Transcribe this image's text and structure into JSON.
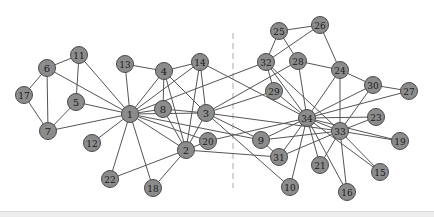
{
  "diagram": {
    "type": "network-graph",
    "node_fill": "#8c8c8c",
    "node_stroke": "#4a4a4a",
    "edge_color": "#555555",
    "divider_color": "#aaaaaa",
    "divider_x": 233,
    "nodes": [
      {
        "id": "1",
        "x": 130,
        "y": 114
      },
      {
        "id": "2",
        "x": 186,
        "y": 150
      },
      {
        "id": "3",
        "x": 206,
        "y": 113
      },
      {
        "id": "4",
        "x": 164,
        "y": 71
      },
      {
        "id": "5",
        "x": 76,
        "y": 102
      },
      {
        "id": "6",
        "x": 47,
        "y": 68
      },
      {
        "id": "7",
        "x": 48,
        "y": 131
      },
      {
        "id": "8",
        "x": 163,
        "y": 109
      },
      {
        "id": "9",
        "x": 261,
        "y": 140
      },
      {
        "id": "10",
        "x": 290,
        "y": 187
      },
      {
        "id": "11",
        "x": 79,
        "y": 55
      },
      {
        "id": "12",
        "x": 92,
        "y": 143
      },
      {
        "id": "13",
        "x": 125,
        "y": 64
      },
      {
        "id": "14",
        "x": 200,
        "y": 62
      },
      {
        "id": "15",
        "x": 380,
        "y": 172
      },
      {
        "id": "16",
        "x": 347,
        "y": 192
      },
      {
        "id": "17",
        "x": 24,
        "y": 95
      },
      {
        "id": "18",
        "x": 153,
        "y": 188
      },
      {
        "id": "19",
        "x": 400,
        "y": 141
      },
      {
        "id": "20",
        "x": 208,
        "y": 141
      },
      {
        "id": "21",
        "x": 320,
        "y": 165
      },
      {
        "id": "22",
        "x": 110,
        "y": 179
      },
      {
        "id": "23",
        "x": 376,
        "y": 117
      },
      {
        "id": "24",
        "x": 340,
        "y": 70
      },
      {
        "id": "25",
        "x": 279,
        "y": 31
      },
      {
        "id": "26",
        "x": 320,
        "y": 25
      },
      {
        "id": "27",
        "x": 409,
        "y": 91
      },
      {
        "id": "28",
        "x": 298,
        "y": 61
      },
      {
        "id": "29",
        "x": 274,
        "y": 91
      },
      {
        "id": "30",
        "x": 373,
        "y": 85
      },
      {
        "id": "31",
        "x": 279,
        "y": 157
      },
      {
        "id": "32",
        "x": 266,
        "y": 62
      },
      {
        "id": "33",
        "x": 340,
        "y": 131
      },
      {
        "id": "34",
        "x": 307,
        "y": 118
      }
    ],
    "edges": [
      [
        "1",
        "2"
      ],
      [
        "1",
        "3"
      ],
      [
        "1",
        "4"
      ],
      [
        "1",
        "5"
      ],
      [
        "1",
        "6"
      ],
      [
        "1",
        "7"
      ],
      [
        "1",
        "8"
      ],
      [
        "1",
        "9"
      ],
      [
        "1",
        "11"
      ],
      [
        "1",
        "12"
      ],
      [
        "1",
        "13"
      ],
      [
        "1",
        "14"
      ],
      [
        "1",
        "18"
      ],
      [
        "1",
        "20"
      ],
      [
        "1",
        "22"
      ],
      [
        "1",
        "32"
      ],
      [
        "2",
        "3"
      ],
      [
        "2",
        "4"
      ],
      [
        "2",
        "8"
      ],
      [
        "2",
        "14"
      ],
      [
        "2",
        "18"
      ],
      [
        "2",
        "20"
      ],
      [
        "2",
        "22"
      ],
      [
        "2",
        "31"
      ],
      [
        "3",
        "4"
      ],
      [
        "3",
        "8"
      ],
      [
        "3",
        "9"
      ],
      [
        "3",
        "10"
      ],
      [
        "3",
        "14"
      ],
      [
        "3",
        "28"
      ],
      [
        "3",
        "29"
      ],
      [
        "3",
        "33"
      ],
      [
        "4",
        "8"
      ],
      [
        "4",
        "13"
      ],
      [
        "4",
        "14"
      ],
      [
        "5",
        "7"
      ],
      [
        "5",
        "11"
      ],
      [
        "6",
        "7"
      ],
      [
        "6",
        "11"
      ],
      [
        "6",
        "17"
      ],
      [
        "7",
        "17"
      ],
      [
        "9",
        "31"
      ],
      [
        "9",
        "33"
      ],
      [
        "9",
        "34"
      ],
      [
        "10",
        "34"
      ],
      [
        "14",
        "34"
      ],
      [
        "15",
        "33"
      ],
      [
        "15",
        "34"
      ],
      [
        "16",
        "33"
      ],
      [
        "16",
        "34"
      ],
      [
        "19",
        "33"
      ],
      [
        "19",
        "34"
      ],
      [
        "20",
        "34"
      ],
      [
        "21",
        "33"
      ],
      [
        "21",
        "34"
      ],
      [
        "23",
        "33"
      ],
      [
        "23",
        "34"
      ],
      [
        "24",
        "26"
      ],
      [
        "24",
        "28"
      ],
      [
        "24",
        "30"
      ],
      [
        "24",
        "33"
      ],
      [
        "24",
        "34"
      ],
      [
        "25",
        "26"
      ],
      [
        "25",
        "28"
      ],
      [
        "25",
        "32"
      ],
      [
        "26",
        "32"
      ],
      [
        "27",
        "30"
      ],
      [
        "27",
        "34"
      ],
      [
        "28",
        "34"
      ],
      [
        "29",
        "32"
      ],
      [
        "29",
        "34"
      ],
      [
        "30",
        "33"
      ],
      [
        "30",
        "34"
      ],
      [
        "31",
        "33"
      ],
      [
        "31",
        "34"
      ],
      [
        "32",
        "33"
      ],
      [
        "32",
        "34"
      ],
      [
        "33",
        "34"
      ]
    ]
  }
}
